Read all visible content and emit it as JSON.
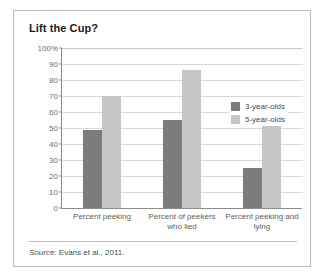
{
  "figure": {
    "title": "Lift the Cup?",
    "source_prefix": "Source:",
    "source_text": " Evans et al., 2011."
  },
  "legend": {
    "items": [
      {
        "label": "3-year-olds",
        "color": "#7c7c7c"
      },
      {
        "label": "5-year-olds",
        "color": "#c6c6c6"
      }
    ]
  },
  "axis": {
    "yticks": [
      "100%",
      "90",
      "80",
      "70",
      "60",
      "50",
      "40",
      "30",
      "20",
      "10",
      "0"
    ]
  },
  "chart_data": {
    "type": "bar",
    "title": "Lift the Cup?",
    "categories": [
      "Percent peeking",
      "Percent of peekers who lied",
      "Percent peeking and lying"
    ],
    "series": [
      {
        "name": "3-year-olds",
        "color": "#7c7c7c",
        "values": [
          49,
          55,
          25
        ]
      },
      {
        "name": "5-year-olds",
        "color": "#c6c6c6",
        "values": [
          70,
          86,
          60
        ]
      }
    ],
    "xlabel": "",
    "ylabel": "",
    "ylim": [
      0,
      100
    ],
    "ytick_step": 10,
    "grid": true,
    "legend_position": "upper right",
    "source": "Source: Evans et al., 2011."
  }
}
